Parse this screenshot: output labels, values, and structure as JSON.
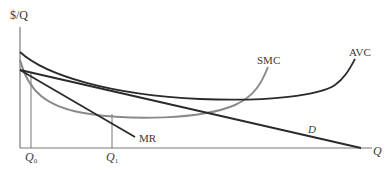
{
  "diagram": {
    "y_axis_label": "$/Q",
    "x_axis_label": "Q",
    "curves": {
      "avc": {
        "label": "AVC",
        "color": "#2a2a2a"
      },
      "smc": {
        "label": "SMC",
        "color": "#8a8a8a"
      },
      "demand": {
        "label": "D",
        "color": "#2a2a2a"
      },
      "mr": {
        "label": "MR",
        "color": "#2a2a2a"
      }
    },
    "quantities": {
      "q0": {
        "main": "Q",
        "sub": "0"
      },
      "q1": {
        "main": "Q",
        "sub": "1"
      }
    },
    "colors": {
      "axis": "#7a7a7a",
      "dark_curve": "#2a2a2a",
      "gray_curve": "#8a8a8a",
      "guide_line": "#777777",
      "text": "#3a3a3a"
    }
  }
}
